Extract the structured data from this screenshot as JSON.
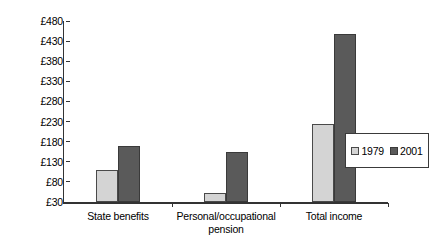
{
  "chart_data": {
    "type": "bar",
    "title": "",
    "subtitle": "",
    "xlabel": "",
    "ylabel": "",
    "categories": [
      "State benefits",
      "Personal/occupational\npension",
      "Total income"
    ],
    "series": [
      {
        "name": "1979",
        "color": "#d4d4d4",
        "values": [
          110,
          53,
          225
        ]
      },
      {
        "name": "2001",
        "color": "#5a5a5a",
        "values": [
          169,
          155,
          447
        ]
      }
    ],
    "ylim": [
      30,
      480
    ],
    "ytick_step": 50,
    "ytick_labels": [
      "£480",
      "£430",
      "£380",
      "£330",
      "£280",
      "£230",
      "£180",
      "£130",
      "£80",
      "£30"
    ],
    "ytick_values": [
      480,
      430,
      380,
      330,
      280,
      230,
      180,
      130,
      80,
      30
    ],
    "grid": false,
    "legend_position": "right",
    "currency_symbol": "£"
  },
  "legend": {
    "entries": [
      {
        "label": "1979"
      },
      {
        "label": "2001"
      }
    ]
  }
}
